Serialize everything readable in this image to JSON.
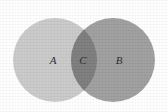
{
  "figure": {
    "type": "venn-diagram",
    "sets_count": 2,
    "background_color": "#fefefe",
    "width": 168,
    "height": 112
  },
  "regions": [
    {
      "key": "set_a",
      "label": "A",
      "role": "left-set",
      "fill": "#c9c9c9",
      "cx": 55,
      "cy": 60,
      "r": 42,
      "label_x": 53,
      "label_y": 60
    },
    {
      "key": "set_b",
      "label": "B",
      "role": "right-set",
      "fill": "#9e9e9e",
      "cx": 113,
      "cy": 60,
      "r": 42,
      "label_x": 119,
      "label_y": 60
    },
    {
      "key": "intersection_c",
      "label": "C",
      "role": "intersection",
      "fill": "#7c7c7c",
      "label_x": 83,
      "label_y": 60
    }
  ],
  "labels": {
    "a": "A",
    "c": "C",
    "b": "B"
  }
}
